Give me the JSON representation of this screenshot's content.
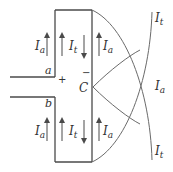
{
  "diagram": {
    "terminals": {
      "a": "a",
      "b": "b"
    },
    "polarity": {
      "plus": "+",
      "minus": "−"
    },
    "node_label": "C",
    "currents": {
      "top_left_outer": {
        "symbol": "I",
        "sub": "a",
        "direction": "up"
      },
      "top_left_inner": {
        "symbol": "I",
        "sub": "t",
        "direction": "up"
      },
      "top_right_inner": {
        "symbol": "I",
        "sub": "a",
        "direction": "down"
      },
      "top_right_outer": {
        "symbol": "I",
        "sub": "a",
        "direction": "up"
      },
      "bottom_left_outer": {
        "symbol": "I",
        "sub": "a",
        "direction": "up"
      },
      "bottom_left_inner": {
        "symbol": "I",
        "sub": "t",
        "direction": "up"
      },
      "bottom_right_inner": {
        "symbol": "I",
        "sub": "a",
        "direction": "down"
      },
      "bottom_right_outer": {
        "symbol": "I",
        "sub": "a",
        "direction": "up"
      }
    },
    "curves": {
      "top": {
        "symbol": "I",
        "sub": "t"
      },
      "middle": {
        "symbol": "I",
        "sub": "a"
      },
      "bottom": {
        "symbol": "I",
        "sub": "t"
      }
    },
    "stroke_color": "#4a4a4a"
  }
}
